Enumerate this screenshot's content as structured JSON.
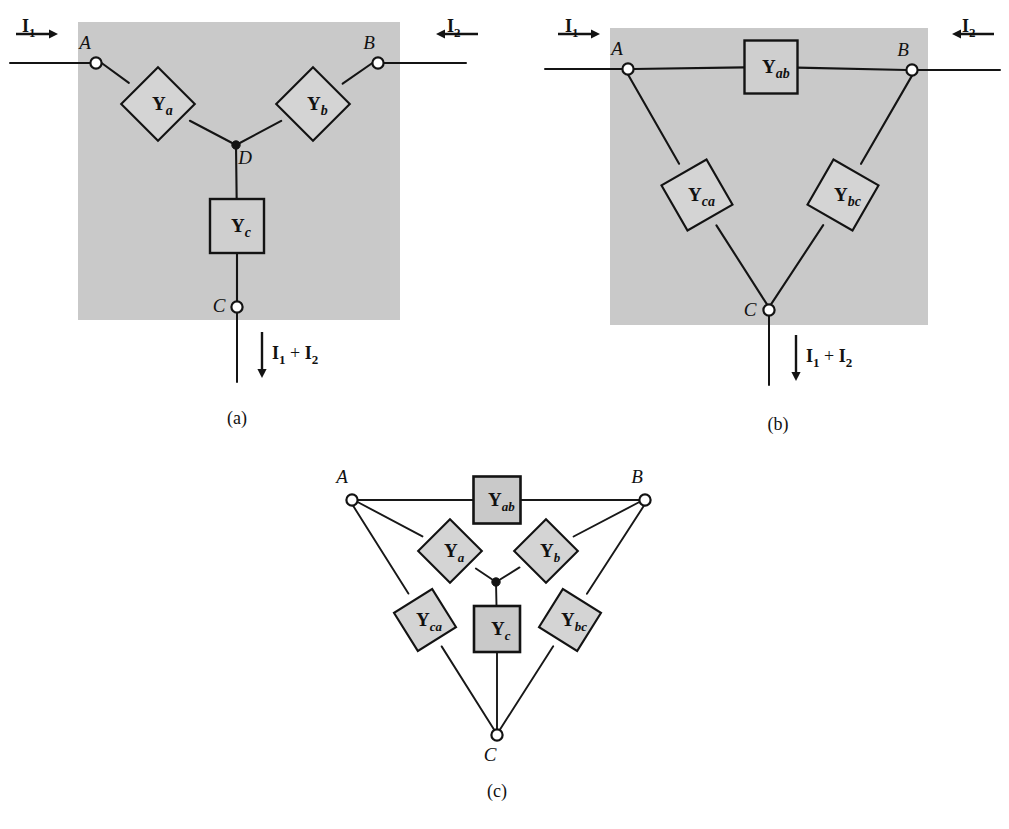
{
  "figure": {
    "background_color": "#ffffff",
    "panel_fill": "#c9c9c9",
    "component_fill": "#cfcfcf",
    "line_color": "#131313"
  },
  "panels": [
    {
      "id": "a",
      "caption": "(a)",
      "caption_pos": {
        "x": 237,
        "y": 424
      },
      "network_type": "Y (star) network",
      "bg": {
        "x": 78,
        "y": 22,
        "w": 322,
        "h": 298
      },
      "nodes": [
        {
          "name": "A",
          "label": "A",
          "x": 96,
          "y": 63,
          "label_x": 85,
          "label_y": 49,
          "type": "terminal"
        },
        {
          "name": "B",
          "label": "B",
          "x": 378,
          "y": 63,
          "label_x": 369,
          "label_y": 49,
          "type": "terminal"
        },
        {
          "name": "C",
          "label": "C",
          "x": 237,
          "y": 307,
          "label_x": 219,
          "label_y": 312,
          "type": "terminal"
        },
        {
          "name": "D",
          "label": "D",
          "x": 236,
          "y": 145,
          "label_x": 245,
          "label_y": 164,
          "type": "junction"
        }
      ],
      "components": [
        {
          "name": "Y_a",
          "symbol": "Y",
          "subscript": "a",
          "cx": 158,
          "cy": 104,
          "size": 52,
          "rotation": -45,
          "style": "diamond"
        },
        {
          "name": "Y_b",
          "symbol": "Y",
          "subscript": "b",
          "cx": 313,
          "cy": 104,
          "size": 52,
          "rotation": 45,
          "style": "diamond"
        },
        {
          "name": "Y_c",
          "symbol": "Y",
          "subscript": "c",
          "cx": 237,
          "cy": 226,
          "size": 54,
          "rotation": 0,
          "style": "square"
        }
      ],
      "currents": [
        {
          "name": "I1",
          "symbol": "I",
          "subscript": "1",
          "label_x": 22,
          "label_y": 18,
          "arrow": {
            "x1": 16,
            "y1": 34,
            "x2": 58,
            "y2": 34,
            "dir": "right"
          }
        },
        {
          "name": "I2",
          "symbol": "I",
          "subscript": "2",
          "label_x": 447,
          "label_y": 18,
          "arrow": {
            "x1": 478,
            "y1": 34,
            "x2": 436,
            "y2": 34,
            "dir": "left"
          }
        },
        {
          "name": "I1+I2",
          "symbol": "I",
          "subscript": "1",
          "symbol2": "I",
          "subscript2": "2",
          "plus": "+",
          "label_x": 272,
          "label_y": 345,
          "arrow": {
            "x1": 262,
            "y1": 332,
            "x2": 262,
            "y2": 378,
            "dir": "down"
          }
        }
      ]
    },
    {
      "id": "b",
      "caption": "(b)",
      "caption_pos": {
        "x": 778,
        "y": 430
      },
      "network_type": "Delta (mesh) network",
      "bg": {
        "x": 610,
        "y": 28,
        "w": 318,
        "h": 297
      },
      "nodes": [
        {
          "name": "A",
          "label": "A",
          "x": 628,
          "y": 69,
          "label_x": 617,
          "label_y": 55,
          "type": "terminal"
        },
        {
          "name": "B",
          "label": "B",
          "x": 912,
          "y": 70,
          "label_x": 903,
          "label_y": 56,
          "type": "terminal"
        },
        {
          "name": "C",
          "label": "C",
          "x": 769,
          "y": 310,
          "label_x": 750,
          "label_y": 316,
          "type": "terminal"
        }
      ],
      "components": [
        {
          "name": "Y_ab",
          "symbol": "Y",
          "subscript": "ab",
          "cx": 771,
          "cy": 67,
          "size": 53,
          "rotation": 0,
          "style": "square"
        },
        {
          "name": "Y_ca",
          "symbol": "Y",
          "subscript": "ca",
          "cx": 697,
          "cy": 195,
          "size": 52,
          "rotation": -30,
          "style": "diamond"
        },
        {
          "name": "Y_bc",
          "symbol": "Y",
          "subscript": "bc",
          "cx": 843,
          "cy": 195,
          "size": 52,
          "rotation": 30,
          "style": "diamond"
        }
      ],
      "currents": [
        {
          "name": "I1",
          "symbol": "I",
          "subscript": "1",
          "label_x": 565,
          "label_y": 18,
          "arrow": {
            "x1": 558,
            "y1": 34,
            "x2": 600,
            "y2": 34,
            "dir": "right"
          }
        },
        {
          "name": "I2",
          "symbol": "I",
          "subscript": "2",
          "label_x": 962,
          "label_y": 18,
          "arrow": {
            "x1": 994,
            "y1": 34,
            "x2": 952,
            "y2": 34,
            "dir": "left"
          }
        },
        {
          "name": "I1+I2",
          "symbol": "I",
          "subscript": "1",
          "symbol2": "I",
          "subscript2": "2",
          "plus": "+",
          "label_x": 806,
          "label_y": 348,
          "arrow": {
            "x1": 796,
            "y1": 335,
            "x2": 796,
            "y2": 381,
            "dir": "down"
          }
        }
      ]
    },
    {
      "id": "c",
      "caption": "(c)",
      "caption_pos": {
        "x": 497,
        "y": 797
      },
      "network_type": "Combined Y and Delta network",
      "bg": null,
      "nodes": [
        {
          "name": "A",
          "label": "A",
          "x": 352,
          "y": 500,
          "label_x": 342,
          "label_y": 483,
          "type": "terminal"
        },
        {
          "name": "B",
          "label": "B",
          "x": 645,
          "y": 500,
          "label_x": 637,
          "label_y": 483,
          "type": "terminal"
        },
        {
          "name": "C",
          "label": "C",
          "x": 497,
          "y": 735,
          "label_x": 490,
          "label_y": 761,
          "type": "terminal"
        },
        {
          "name": "D",
          "label": "",
          "x": 496,
          "y": 582,
          "label_x": 0,
          "label_y": 0,
          "type": "junction"
        }
      ],
      "components": [
        {
          "name": "Y_ab",
          "symbol": "Y",
          "subscript": "ab",
          "cx": 497,
          "cy": 500,
          "size": 47,
          "rotation": 0,
          "style": "square"
        },
        {
          "name": "Y_a",
          "symbol": "Y",
          "subscript": "a",
          "cx": 450,
          "cy": 551,
          "size": 45,
          "rotation": -45,
          "style": "diamond"
        },
        {
          "name": "Y_b",
          "symbol": "Y",
          "subscript": "b",
          "cx": 546,
          "cy": 551,
          "size": 45,
          "rotation": 45,
          "style": "diamond"
        },
        {
          "name": "Y_ca",
          "symbol": "Y",
          "subscript": "ca",
          "cx": 425,
          "cy": 620,
          "size": 45,
          "rotation": -32,
          "style": "diamond"
        },
        {
          "name": "Y_c",
          "symbol": "Y",
          "subscript": "c",
          "cx": 497,
          "cy": 629,
          "size": 46,
          "rotation": 0,
          "style": "square"
        },
        {
          "name": "Y_bc",
          "symbol": "Y",
          "subscript": "bc",
          "cx": 570,
          "cy": 620,
          "size": 45,
          "rotation": 32,
          "style": "diamond"
        }
      ],
      "currents": []
    }
  ],
  "terminal_radius": 5.6,
  "junction_radius": 4.2
}
